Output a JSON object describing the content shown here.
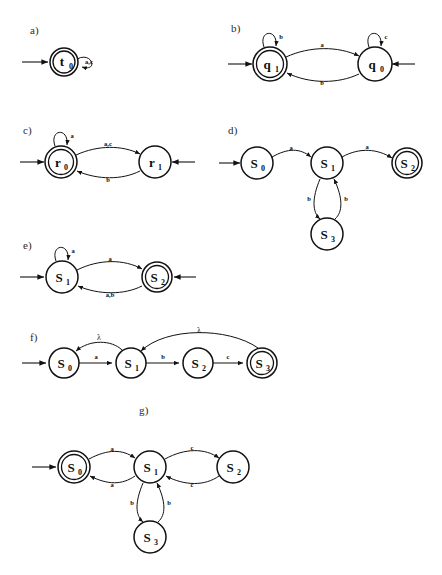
{
  "figure": {
    "caption": "",
    "panels": [
      {
        "id": "a",
        "label": "a)",
        "states": [
          {
            "name": "t",
            "sub": "0",
            "accepting": true
          }
        ],
        "self_loops": [
          {
            "state": "t0",
            "symbols": "a,c"
          }
        ],
        "edges": [],
        "start_arrows": [
          "left"
        ]
      },
      {
        "id": "b",
        "label": "b)",
        "states": [
          {
            "name": "q",
            "sub": "1",
            "accepting": true
          },
          {
            "name": "q",
            "sub": "0",
            "accepting": false
          }
        ],
        "self_loops": [
          {
            "state": "q1",
            "symbols": "b"
          },
          {
            "state": "q0",
            "symbols": "c"
          }
        ],
        "edges": [
          {
            "from": "q1",
            "to": "q0",
            "symbols": "a"
          },
          {
            "from": "q0",
            "to": "q1",
            "symbols": "b"
          }
        ],
        "start_arrows": [
          "left",
          "right"
        ]
      },
      {
        "id": "c",
        "label": "c)",
        "states": [
          {
            "name": "r",
            "sub": "0",
            "accepting": true
          },
          {
            "name": "r",
            "sub": "1",
            "accepting": false
          }
        ],
        "self_loops": [
          {
            "state": "r0",
            "symbols": "a"
          }
        ],
        "edges": [
          {
            "from": "r0",
            "to": "r1",
            "symbols": "a,c"
          },
          {
            "from": "r1",
            "to": "r0",
            "symbols": "b"
          }
        ],
        "start_arrows": [
          "left",
          "right"
        ]
      },
      {
        "id": "d",
        "label": "d)",
        "states": [
          {
            "name": "S",
            "sub": "0",
            "accepting": false
          },
          {
            "name": "S",
            "sub": "1",
            "accepting": false
          },
          {
            "name": "S",
            "sub": "2",
            "accepting": true
          },
          {
            "name": "S",
            "sub": "3",
            "accepting": false
          }
        ],
        "self_loops": [],
        "edges": [
          {
            "from": "S0",
            "to": "S1",
            "symbols": "a"
          },
          {
            "from": "S1",
            "to": "S2",
            "symbols": "a"
          },
          {
            "from": "S1",
            "to": "S3",
            "symbols": "b"
          },
          {
            "from": "S3",
            "to": "S1",
            "symbols": "b"
          }
        ],
        "start_arrows": [
          "left"
        ]
      },
      {
        "id": "e",
        "label": "e)",
        "states": [
          {
            "name": "S",
            "sub": "1",
            "accepting": false
          },
          {
            "name": "S",
            "sub": "2",
            "accepting": true
          }
        ],
        "self_loops": [
          {
            "state": "S1",
            "symbols": "a"
          }
        ],
        "edges": [
          {
            "from": "S1",
            "to": "S2",
            "symbols": "a"
          },
          {
            "from": "S2",
            "to": "S1",
            "symbols": "a,b"
          }
        ],
        "start_arrows": [
          "left",
          "right"
        ]
      },
      {
        "id": "f",
        "label": "f)",
        "states": [
          {
            "name": "S",
            "sub": "0",
            "accepting": false
          },
          {
            "name": "S",
            "sub": "1",
            "accepting": false
          },
          {
            "name": "S",
            "sub": "2",
            "accepting": false
          },
          {
            "name": "S",
            "sub": "3",
            "accepting": true
          }
        ],
        "self_loops": [],
        "edges": [
          {
            "from": "S0",
            "to": "S1",
            "symbols": "a"
          },
          {
            "from": "S1",
            "to": "S2",
            "symbols": "b"
          },
          {
            "from": "S2",
            "to": "S3",
            "symbols": "c"
          },
          {
            "from": "S1",
            "to": "S0",
            "symbols": "λ"
          },
          {
            "from": "S3",
            "to": "S1",
            "symbols": "λ"
          }
        ],
        "start_arrows": [
          "left"
        ]
      },
      {
        "id": "g",
        "label": "g)",
        "states": [
          {
            "name": "S",
            "sub": "0",
            "accepting": true
          },
          {
            "name": "S",
            "sub": "1",
            "accepting": false
          },
          {
            "name": "S",
            "sub": "2",
            "accepting": false
          },
          {
            "name": "S",
            "sub": "3",
            "accepting": false
          }
        ],
        "self_loops": [],
        "edges": [
          {
            "from": "S0",
            "to": "S1",
            "symbols": "a"
          },
          {
            "from": "S1",
            "to": "S0",
            "symbols": "a"
          },
          {
            "from": "S1",
            "to": "S2",
            "symbols": "c"
          },
          {
            "from": "S2",
            "to": "S1",
            "symbols": "c"
          },
          {
            "from": "S1",
            "to": "S3",
            "symbols": "b"
          },
          {
            "from": "S3",
            "to": "S1",
            "symbols": "b"
          }
        ],
        "start_arrows": [
          "left"
        ]
      }
    ]
  },
  "labels": {
    "a_state_t0": "t",
    "a_state_t0_sub": "0",
    "a_loop": "a,c",
    "b_state_q1": "q",
    "b_state_q1_sub": "1",
    "b_state_q0": "q",
    "b_state_q0_sub": "0",
    "b_loop_q1": "b",
    "b_loop_q0": "c",
    "b_edge_top": "a",
    "b_edge_bottom": "b",
    "c_state_r0": "r",
    "c_state_r0_sub": "0",
    "c_state_r1": "r",
    "c_state_r1_sub": "1",
    "c_loop_r0": "a",
    "c_edge_top": "a,c",
    "c_edge_bottom": "b",
    "d_state_s0": "S",
    "d_state_s0_sub": "0",
    "d_state_s1": "S",
    "d_state_s1_sub": "1",
    "d_state_s2": "S",
    "d_state_s2_sub": "2",
    "d_state_s3": "S",
    "d_state_s3_sub": "3",
    "d_edge_s0_s1": "a",
    "d_edge_s1_s2": "a",
    "d_edge_s1_s3": "b",
    "d_edge_s3_s1": "b",
    "e_state_s1": "S",
    "e_state_s1_sub": "1",
    "e_state_s2": "S",
    "e_state_s2_sub": "2",
    "e_loop_s1": "a",
    "e_edge_top": "a",
    "e_edge_bottom": "a,b",
    "f_state_s0": "S",
    "f_state_s0_sub": "0",
    "f_state_s1": "S",
    "f_state_s1_sub": "1",
    "f_state_s2": "S",
    "f_state_s2_sub": "2",
    "f_state_s3": "S",
    "f_state_s3_sub": "3",
    "f_edge_s0_s1": "a",
    "f_edge_s1_s2": "b",
    "f_edge_s2_s3": "c",
    "f_edge_lam1": "λ",
    "f_edge_lam2": "λ",
    "g_state_s0": "S",
    "g_state_s0_sub": "0",
    "g_state_s1": "S",
    "g_state_s1_sub": "1",
    "g_state_s2": "S",
    "g_state_s2_sub": "2",
    "g_state_s3": "S",
    "g_state_s3_sub": "3",
    "g_edge_s0_s1": "a",
    "g_edge_s1_s0": "a",
    "g_edge_s1_s2": "c",
    "g_edge_s2_s1": "c",
    "g_edge_s1_s3": "b",
    "g_edge_s3_s1": "b",
    "panel_a": "a)",
    "panel_b": "b)",
    "panel_c": "c)",
    "panel_d": "d)",
    "panel_e": "e)",
    "panel_f": "f)",
    "panel_g": "g)"
  }
}
